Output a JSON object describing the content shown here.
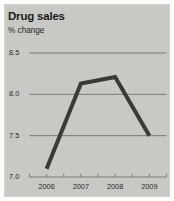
{
  "figure": {
    "background_color": "#fdfdfc",
    "panel_color": "#c8c9c4",
    "title": "Drug sales",
    "subtitle": "% change"
  },
  "chart_data": {
    "type": "line",
    "title": "Drug sales",
    "subtitle": "% change",
    "xlabel": "",
    "ylabel": "% change",
    "categories": [
      "2006",
      "2007",
      "2008",
      "2009"
    ],
    "x": [
      2006,
      2007,
      2008,
      2009
    ],
    "values": [
      7.1,
      8.13,
      8.21,
      7.5
    ],
    "series": [
      {
        "name": "Drug sales % change",
        "values": [
          7.1,
          8.13,
          8.21,
          7.5
        ],
        "color": "#3a3a38",
        "line_width": 4
      }
    ],
    "ylim": [
      7.0,
      8.5
    ],
    "ytick_labels": [
      "8.5",
      "8.0",
      "7.5",
      "7.0"
    ],
    "ytick_values": [
      8.5,
      8.0,
      7.5,
      7.0
    ],
    "xtick_labels": [
      "2006",
      "2007",
      "2008",
      "2009"
    ],
    "grid": true,
    "grid_axis": "y",
    "grid_color": "#74746e",
    "legend": false,
    "legend_position": "none",
    "annotations": []
  },
  "axes": {
    "y_ticks": [
      {
        "label": "8.5",
        "value": 8.5
      },
      {
        "label": "8.0",
        "value": 8.0
      },
      {
        "label": "7.5",
        "value": 7.5
      },
      {
        "label": "7.0",
        "value": 7.0
      }
    ],
    "x_ticks": [
      {
        "label": "2006",
        "value": 2006
      },
      {
        "label": "2007",
        "value": 2007
      },
      {
        "label": "2008",
        "value": 2008
      },
      {
        "label": "2009",
        "value": 2009
      }
    ]
  }
}
